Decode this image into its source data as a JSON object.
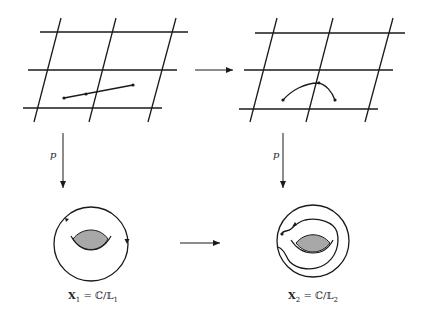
{
  "diagram": {
    "type": "commutative diagram of lattice coverings and tori",
    "top_left": {
      "name": "lattice-L1",
      "description": "parallelogram grid with straight path segment"
    },
    "top_right": {
      "name": "lattice-L2",
      "description": "parallelogram grid with curved path"
    },
    "bottom_left": {
      "name": "torus-X1",
      "description": "torus with closed loop"
    },
    "bottom_right": {
      "name": "torus-X2",
      "description": "torus with spiraling path"
    },
    "arrows": {
      "top": {
        "from": "lattice-L1",
        "to": "lattice-L2",
        "label": ""
      },
      "bottom": {
        "from": "torus-X1",
        "to": "torus-X2",
        "label": ""
      },
      "left": {
        "from": "lattice-L1",
        "to": "torus-X1",
        "label": "p"
      },
      "right": {
        "from": "lattice-L2",
        "to": "torus-X2",
        "label": "p"
      }
    },
    "labels": {
      "left_p": "p",
      "right_p": "p",
      "x1": {
        "var": "X",
        "sub": "1",
        "eq": "=",
        "quot": "ℂ/𝕃",
        "qsub": "1"
      },
      "x2": {
        "var": "X",
        "sub": "2",
        "eq": "=",
        "quot": "ℂ/𝕃",
        "qsub": "2"
      }
    },
    "colors": {
      "stroke": "#1a1a1a",
      "hole_fill": "#a8a8a8",
      "background": "#ffffff"
    }
  }
}
